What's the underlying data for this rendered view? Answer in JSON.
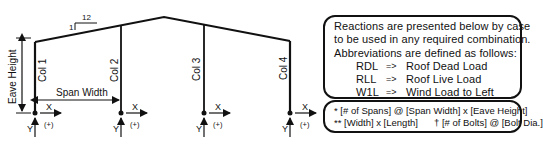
{
  "diagram": {
    "slope": {
      "rise": "1",
      "run": "12"
    },
    "eave_height_label": "Eave Height",
    "span_width_label": "Span Width",
    "columns": [
      {
        "label": "Col 1",
        "x_label": "X",
        "y_label": "Y",
        "sign": "(+)"
      },
      {
        "label": "Col 2",
        "x_label": "X",
        "y_label": "Y",
        "sign": "(+)"
      },
      {
        "label": "Col 3",
        "x_label": "X",
        "y_label": "Y",
        "sign": "(+)"
      },
      {
        "label": "Col 4",
        "x_label": "X",
        "y_label": "Y",
        "sign": "(+)"
      }
    ]
  },
  "legend": {
    "intro": [
      "Reactions are presented below by case",
      "to be used in any required combination.",
      "Abbreviations are defined as follows:"
    ],
    "abbreviations": [
      {
        "code": "RDL",
        "arrow": "=>",
        "meaning": "Roof Dead Load"
      },
      {
        "code": "RLL",
        "arrow": "=>",
        "meaning": "Roof Live Load"
      },
      {
        "code": "W1L",
        "arrow": "=>",
        "meaning": "Wind Load to Left"
      },
      {
        "code": "W1R",
        "arrow": "=>",
        "meaning": "Wind Load to Right"
      }
    ]
  },
  "notes": {
    "line1": "* [# of Spans] @ [Span Width] x [Eave Height]",
    "line2a": "** [Width] x [Length]",
    "line2b": "† [# of Bolts] @ [Bolt Dia.]"
  }
}
